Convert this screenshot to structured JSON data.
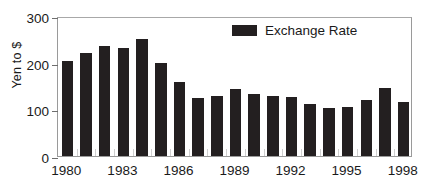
{
  "chart_data": {
    "type": "bar",
    "title": "",
    "xlabel": "",
    "ylabel": "Yen to $",
    "ylim": [
      0,
      300
    ],
    "yticks": [
      0,
      100,
      200,
      300
    ],
    "grid": false,
    "legend_position": "top-right",
    "legend": [
      "Exchange Rate"
    ],
    "bar_color": "#231f20",
    "categories": [
      "1980",
      "1981",
      "1982",
      "1983",
      "1984",
      "1985",
      "1986",
      "1987",
      "1988",
      "1989",
      "1990",
      "1991",
      "1992",
      "1993",
      "1994",
      "1995",
      "1996",
      "1997",
      "1998"
    ],
    "xtick_labels": [
      "1980",
      "1983",
      "1986",
      "1989",
      "1992",
      "1995",
      "1998"
    ],
    "series": [
      {
        "name": "Exchange Rate",
        "values": [
          204,
          220,
          235,
          232,
          251,
          200,
          159,
          124,
          128,
          143,
          133,
          128,
          126,
          112,
          102,
          104,
          121,
          146,
          115
        ]
      }
    ]
  },
  "axis": {
    "y_title": "Yen to $",
    "y_tick_0": "0",
    "y_tick_100": "100",
    "y_tick_200": "200",
    "y_tick_300": "300"
  },
  "legend": {
    "label": "Exchange Rate",
    "swatch_color": "#231f20"
  }
}
